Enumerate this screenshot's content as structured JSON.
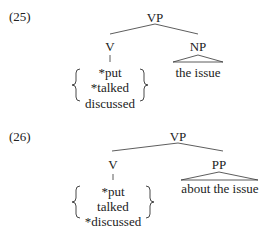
{
  "examples": [
    {
      "number": "(25)",
      "root": "VP",
      "left": {
        "label": "V",
        "options": [
          "*put",
          "*talked",
          "discussed"
        ]
      },
      "right": {
        "label": "NP",
        "phrase": "the issue"
      }
    },
    {
      "number": "(26)",
      "root": "VP",
      "left": {
        "label": "V",
        "options": [
          "*put",
          "talked",
          "*discussed"
        ]
      },
      "right": {
        "label": "PP",
        "phrase": "about the issue"
      }
    }
  ]
}
